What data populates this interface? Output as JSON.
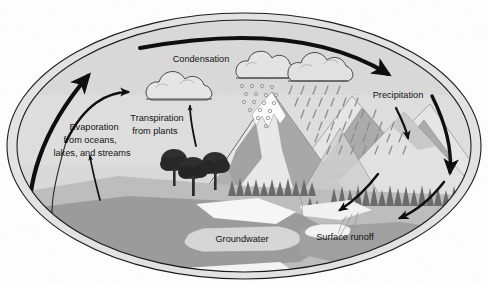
{
  "diagram": {
    "shape": "ellipse-cross-section",
    "labels": {
      "condensation": "Condensation",
      "evaporation_line1": "Evaporation",
      "evaporation_line2": "from oceans,",
      "evaporation_line3": "lakes, and streams",
      "transpiration_line1": "Transpiration",
      "transpiration_line2": "from plants",
      "precipitation": "Precipitation",
      "groundwater": "Groundwater",
      "surface_runoff": "Surface runoff"
    },
    "elements": {
      "cloud_condensation": "cloud-icon",
      "cloud_snow": "cloud-snow-icon",
      "cloud_rain": "cloud-rain-icon",
      "snow_particles": "snowflake-icon",
      "rain_streaks": "raindrop-icon",
      "mountain_peak": "mountain-icon",
      "snow_cap": "snowcap-icon",
      "trees_deciduous": "tree-icon",
      "forest_conifer": "conifer-forest-icon",
      "ocean": "water-body-icon",
      "groundwater_pocket": "aquifer-icon",
      "runoff_stream": "stream-icon"
    },
    "arrows": {
      "evaporation_major": "arrow-up-left-thick",
      "evaporation_minor": "arrow-up-curve",
      "evaporation_ocean": "arrow-up-small",
      "transpiration": "arrow-up-from-trees",
      "transport_aloft": "arrow-right-thick",
      "precipitation_fall_1": "arrow-down-short",
      "precipitation_fall_2": "arrow-down-long",
      "runoff_down_1": "arrow-down-left",
      "runoff_down_2": "arrow-down-left-long",
      "return_to_ocean": "arrow-left-thick"
    },
    "colors": {
      "sky": "#d8d8d8",
      "ground": "#b8b8b8",
      "water": "#9a9a9a",
      "sand": "#f6f6f6",
      "mountain_light": "#e8e8e8",
      "mountain_mid": "#9e9e9e",
      "mountain_dark": "#8a8a8a",
      "forest": "#6b6b6b",
      "trees": "#2e2e2e",
      "outline": "#1a1a1a",
      "arrow": "#0d0d0d",
      "text": "#111111",
      "page": "#fdfdfd"
    }
  }
}
